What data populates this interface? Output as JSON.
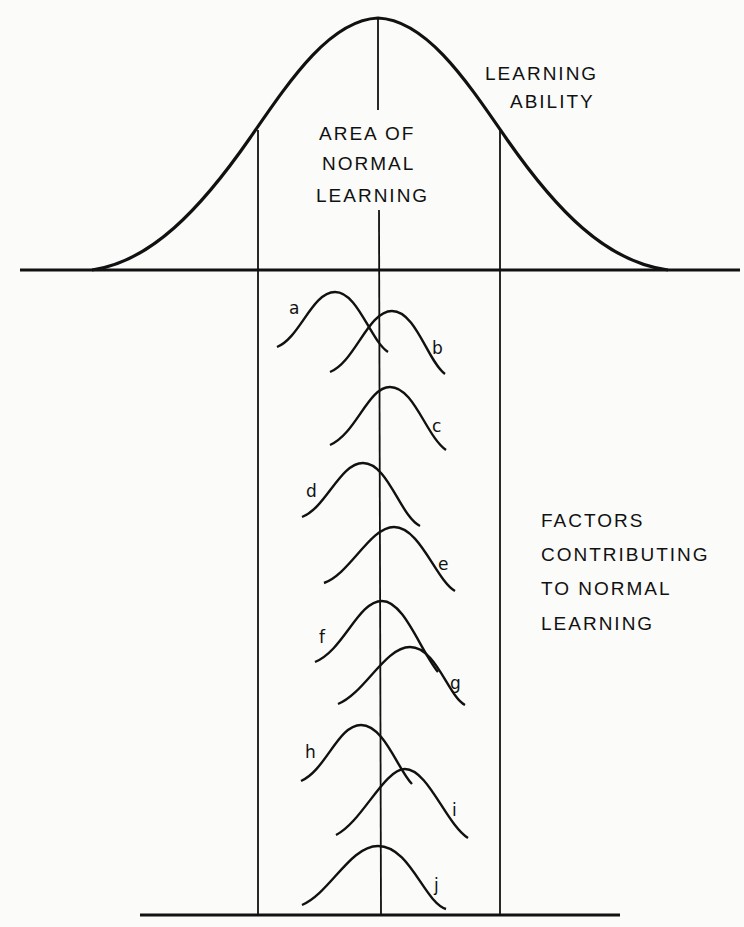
{
  "diagram": {
    "main_curve_label": [
      "LEARNING",
      "ABILITY"
    ],
    "center_label": [
      "AREA OF",
      "NORMAL",
      "LEARNING"
    ],
    "factors_label": [
      "FACTORS",
      "CONTRIBUTING",
      "TO NORMAL",
      "LEARNING"
    ],
    "factors": [
      {
        "id": "a",
        "label": "a"
      },
      {
        "id": "b",
        "label": "b"
      },
      {
        "id": "c",
        "label": "c"
      },
      {
        "id": "d",
        "label": "d"
      },
      {
        "id": "e",
        "label": "e"
      },
      {
        "id": "f",
        "label": "f"
      },
      {
        "id": "g",
        "label": "g"
      },
      {
        "id": "h",
        "label": "h"
      },
      {
        "id": "i",
        "label": "i"
      },
      {
        "id": "j",
        "label": "j"
      }
    ],
    "colors": {
      "ink": "#111111",
      "paper": "#fbfbfa"
    }
  }
}
